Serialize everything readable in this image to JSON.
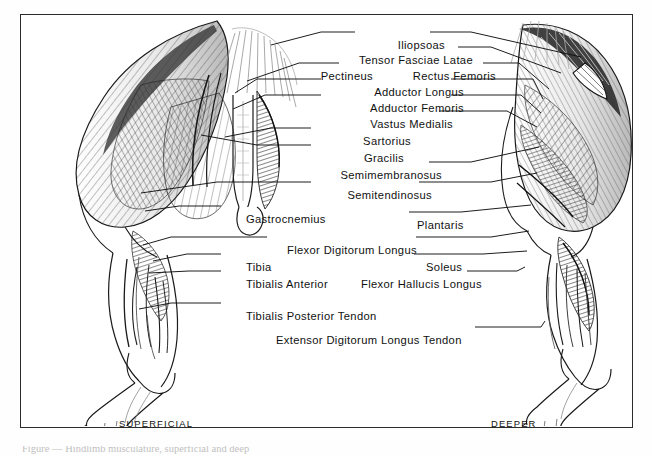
{
  "figure": {
    "kind": "anatomical-plate",
    "view_captions": [
      {
        "id": "superficial",
        "text": "SUPERFICIAL",
        "x": 118,
        "y": 421
      },
      {
        "id": "deeper",
        "text": "DEEPER",
        "x": 490,
        "y": 421
      }
    ],
    "caption_below": "Figure — Hindlimb musculature, superficial and deep",
    "frame": {
      "x": 20,
      "y": 14,
      "width": 613,
      "height": 414,
      "color": "#2b2b2b"
    },
    "ink_color": "#111111",
    "paper_color": "#ffffff"
  },
  "labels": [
    {
      "id": "iliopsoas",
      "text": "Iliopsoas",
      "x": 424,
      "y": 31,
      "align": "right"
    },
    {
      "id": "tensor-fasciae-latae",
      "text": "Tensor Fasciae Latae",
      "x": 452,
      "y": 46,
      "align": "right"
    },
    {
      "id": "pectineus",
      "text": "Pectineus",
      "x": 352,
      "y": 62,
      "align": "right"
    },
    {
      "id": "rectus-femoris",
      "text": "Rectus Femoris",
      "x": 475,
      "y": 62,
      "align": "right"
    },
    {
      "id": "adductor-longus",
      "text": "Adductor Longus",
      "x": 443,
      "y": 78,
      "align": "right"
    },
    {
      "id": "adductor-femoris",
      "text": "Adductor Femoris",
      "x": 443,
      "y": 94,
      "align": "right"
    },
    {
      "id": "vastus-medialis",
      "text": "Vastus Medialis",
      "x": 432,
      "y": 110,
      "align": "right"
    },
    {
      "id": "sartorius",
      "text": "Sartorius",
      "x": 390,
      "y": 127,
      "align": "right"
    },
    {
      "id": "gracilis",
      "text": "Gracilis",
      "x": 383,
      "y": 144,
      "align": "right"
    },
    {
      "id": "semimembranosus",
      "text": "Semimembranosus",
      "x": 421,
      "y": 161,
      "align": "right"
    },
    {
      "id": "semitendinosus",
      "text": "Semitendinosus",
      "x": 411,
      "y": 181,
      "align": "right"
    },
    {
      "id": "gastrocnemius",
      "text": "Gastrocnemius",
      "x": 225,
      "y": 205,
      "align": "left"
    },
    {
      "id": "plantaris",
      "text": "Plantaris",
      "x": 396,
      "y": 211,
      "align": "left"
    },
    {
      "id": "flexor-digitorum-longus",
      "text": "Flexor Digitorum Longus",
      "x": 266,
      "y": 236,
      "align": "left"
    },
    {
      "id": "tibia",
      "text": "Tibia",
      "x": 225,
      "y": 253,
      "align": "left"
    },
    {
      "id": "soleus",
      "text": "Soleus",
      "x": 405,
      "y": 253,
      "align": "left"
    },
    {
      "id": "tibialis-anterior",
      "text": "Tibialis Anterior",
      "x": 225,
      "y": 270,
      "align": "left"
    },
    {
      "id": "flexor-hallucis-longus",
      "text": "Flexor Hallucis Longus",
      "x": 340,
      "y": 270,
      "align": "left"
    },
    {
      "id": "tibialis-posterior-tendon",
      "text": "Tibialis Posterior Tendon",
      "x": 225,
      "y": 302,
      "align": "left"
    },
    {
      "id": "extensor-digitorum-longus-tendon",
      "text": "Extensor Digitorum Longus Tendon",
      "x": 255,
      "y": 326,
      "align": "left"
    }
  ]
}
